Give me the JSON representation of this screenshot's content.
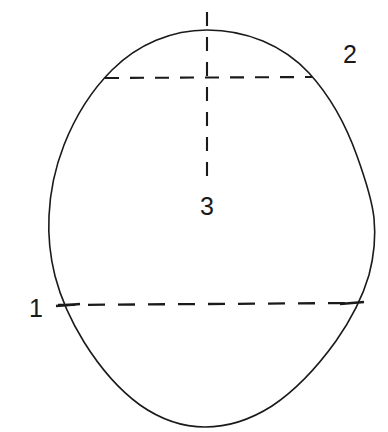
{
  "figure": {
    "type": "line-drawing",
    "background_color": "#ffffff",
    "stroke_color": "#1a1a1a",
    "canvas": {
      "width": 388,
      "height": 432
    }
  },
  "labels": [
    {
      "id": "1",
      "text": "1",
      "x": 29,
      "y": 296,
      "describes": "lower horizontal reference plane"
    },
    {
      "id": "2",
      "text": "2",
      "x": 343,
      "y": 42,
      "describes": "upper horizontal reference plane"
    },
    {
      "id": "3",
      "text": "3",
      "x": 200,
      "y": 194,
      "describes": "vertical midline reference plane"
    }
  ],
  "outline": {
    "name": "cranium-outline",
    "style": "solid",
    "stroke_width": 1.6,
    "extremes": {
      "top_y": 30,
      "bottom_y": 427,
      "left_x": 48,
      "right_x": 376,
      "apex_x": 207,
      "base_x": 205
    }
  },
  "reference_lines": [
    {
      "name": "upper-horizontal-plane",
      "label_ref": "2",
      "style": "dashed",
      "orientation": "horizontal",
      "y": 78,
      "x_start": 105,
      "x_end": 312,
      "dash": "14 11"
    },
    {
      "name": "lower-horizontal-plane",
      "label_ref": "1",
      "style": "dashed",
      "orientation": "horizontal",
      "y": 304,
      "x_start": 58,
      "x_end": 352,
      "dash": "17 13"
    },
    {
      "name": "vertical-midline-plane",
      "label_ref": "3",
      "style": "dashed",
      "orientation": "vertical",
      "x": 207,
      "y_start": 12,
      "y_end": 186,
      "dash": "14 11"
    }
  ],
  "tick_marks": [
    {
      "name": "tick-left-lower",
      "x": 62,
      "y": 305,
      "length": 18,
      "angle_deg": 0
    },
    {
      "name": "tick-right-lower",
      "x": 352,
      "y": 303,
      "length": 18,
      "angle_deg": 0
    }
  ]
}
